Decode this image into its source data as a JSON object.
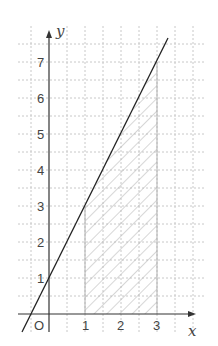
{
  "diagram": {
    "type": "coordinate-plane",
    "axis_labels": {
      "x": "x",
      "y": "y",
      "origin": "O"
    },
    "x_ticks": [
      "1",
      "2",
      "3"
    ],
    "y_ticks": [
      "1",
      "2",
      "3",
      "4",
      "5",
      "6",
      "7"
    ],
    "line": {
      "equation": "y = 2x + 1",
      "points": [
        [
          0,
          1
        ],
        [
          3,
          7
        ]
      ]
    },
    "shaded_region": {
      "x_from": 1,
      "x_to": 3,
      "bounded_above_by": "y = 2x + 1",
      "bounded_below_by": "x-axis",
      "style": "hatched"
    },
    "grid": {
      "step": 0.5,
      "style": "dashed"
    },
    "colors": {
      "axis": "#333333",
      "line": "#222222",
      "grid": "#c8c8c8",
      "hatch": "#b0b0b0",
      "text": "#444444"
    }
  }
}
